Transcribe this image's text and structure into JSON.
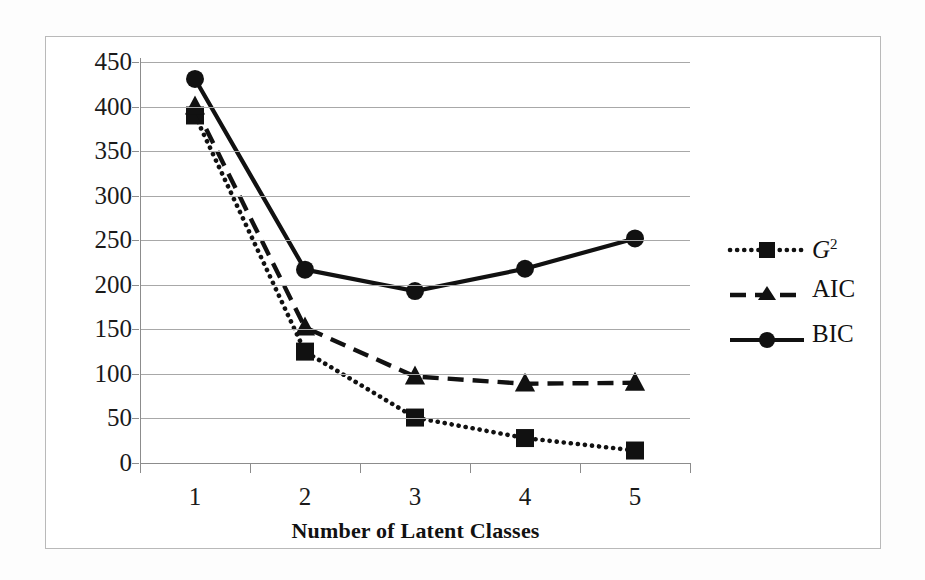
{
  "chart_data": {
    "type": "line",
    "title": "",
    "subtitle": "",
    "xlabel": "Number of Latent Classes",
    "ylabel": "",
    "categories": [
      "1",
      "2",
      "3",
      "4",
      "5"
    ],
    "x": [
      1,
      2,
      3,
      4,
      5
    ],
    "xlim": [
      0.5,
      5.5
    ],
    "ylim": [
      0,
      450
    ],
    "yticks": [
      0,
      50,
      100,
      150,
      200,
      250,
      300,
      350,
      400,
      450
    ],
    "ytick_labels": [
      "0",
      "50",
      "100",
      "150",
      "200",
      "250",
      "300",
      "350",
      "400",
      "450"
    ],
    "grid": "horizontal",
    "legend_position": "right",
    "series": [
      {
        "name": "G2",
        "label": "G",
        "label_superscript": "2",
        "values": [
          390,
          125,
          51,
          28,
          14
        ],
        "line_style": "dotted",
        "marker": "square",
        "color": "#111111"
      },
      {
        "name": "AIC",
        "label": "AIC",
        "label_superscript": "",
        "values": [
          400,
          152,
          97,
          89,
          90
        ],
        "line_style": "dashed",
        "marker": "triangle",
        "color": "#111111"
      },
      {
        "name": "BIC",
        "label": "BIC",
        "label_superscript": "",
        "values": [
          431,
          217,
          193,
          218,
          252
        ],
        "line_style": "solid",
        "marker": "circle",
        "color": "#111111"
      }
    ]
  },
  "figure": {
    "border_color": "#b9b9b9",
    "grid_color": "#a8a8a8",
    "axis_color": "#8c8c8c",
    "text_color": "#111111",
    "background": "#ffffff"
  }
}
